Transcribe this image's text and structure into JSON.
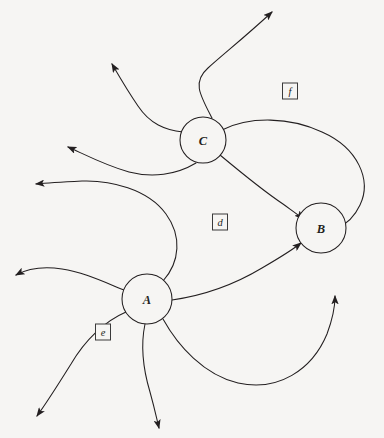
{
  "diagram": {
    "background_color": "#f6f5f3",
    "stroke_color": "#231f20",
    "width": 384,
    "height": 438,
    "nodes": [
      {
        "id": "A",
        "label": "A",
        "cx": 147,
        "cy": 299,
        "r": 25
      },
      {
        "id": "B",
        "label": "B",
        "cx": 321,
        "cy": 228,
        "r": 25
      },
      {
        "id": "C",
        "label": "C",
        "cx": 203,
        "cy": 140,
        "r": 23
      }
    ],
    "regions": [
      {
        "id": "d",
        "label": "d",
        "x": 220,
        "y": 222,
        "w": 15,
        "h": 16
      },
      {
        "id": "e",
        "label": "e",
        "x": 103,
        "y": 332,
        "w": 15,
        "h": 16
      },
      {
        "id": "f",
        "label": "f",
        "x": 290,
        "y": 91,
        "w": 15,
        "h": 16
      }
    ],
    "edges": [
      {
        "name": "edge-c-to-upper-right",
        "from": "C",
        "to": "outside-top-right",
        "arrow": true,
        "path": "M 212 118 C 200 95 192 82 208 68 C 226 52 246 36 272 12"
      },
      {
        "name": "edge-c-to-upper-left",
        "from": "C",
        "to": "outside-top-left",
        "arrow": true,
        "path": "M 183 132 C 165 130 150 124 138 106 C 127 90 119 76 112 64"
      },
      {
        "name": "edge-c-to-left",
        "from": "C",
        "to": "outside-left-upper",
        "arrow": true,
        "path": "M 196 163 C 176 175 152 178 129 172 C 104 165 84 154 68 147"
      },
      {
        "name": "edge-a-to-left-s-curve",
        "from": "A",
        "to": "outside-left-middle",
        "arrow": true,
        "path": "M 163 281 C 180 262 182 236 166 214 C 148 189 110 180 82 181 C 62 182 46 183 36 184"
      },
      {
        "name": "edge-a-to-left-lower",
        "from": "A",
        "to": "outside-left-lower",
        "arrow": true,
        "path": "M 124 290 C 104 282 83 272 62 269 C 42 266 27 269 16 275"
      },
      {
        "name": "edge-a-to-bottom-left",
        "from": "A",
        "to": "outside-bottom-left",
        "arrow": true,
        "path": "M 126 312 C 105 321 85 340 71 364 C 56 388 45 405 37 416"
      },
      {
        "name": "edge-a-to-bottom",
        "from": "A",
        "to": "outside-bottom",
        "arrow": true,
        "path": "M 145 324 C 140 348 144 372 150 392 C 155 410 157 420 159 428"
      },
      {
        "name": "edge-c-to-b-direct",
        "from": "C",
        "to": "B",
        "arrow": true,
        "path": "M 220 155 C 238 170 262 190 283 204 C 294 212 300 216 303 219"
      },
      {
        "name": "edge-c-to-b-around-right",
        "from": "C",
        "to": "B",
        "arrow": true,
        "path": "M 222 130 C 250 116 290 117 322 132 C 358 148 372 180 360 205 C 353 220 342 226 337 228"
      },
      {
        "name": "edge-a-to-b-direct",
        "from": "A",
        "to": "B",
        "arrow": true,
        "path": "M 172 300 C 200 296 232 286 262 268 C 286 254 296 247 301 243"
      },
      {
        "name": "edge-a-to-b-around-bottom",
        "from": "A",
        "to": "B",
        "arrow": true,
        "path": "M 163 319 C 178 346 204 375 238 383 C 278 392 312 370 327 334 C 333 318 335 304 335 296"
      }
    ]
  }
}
